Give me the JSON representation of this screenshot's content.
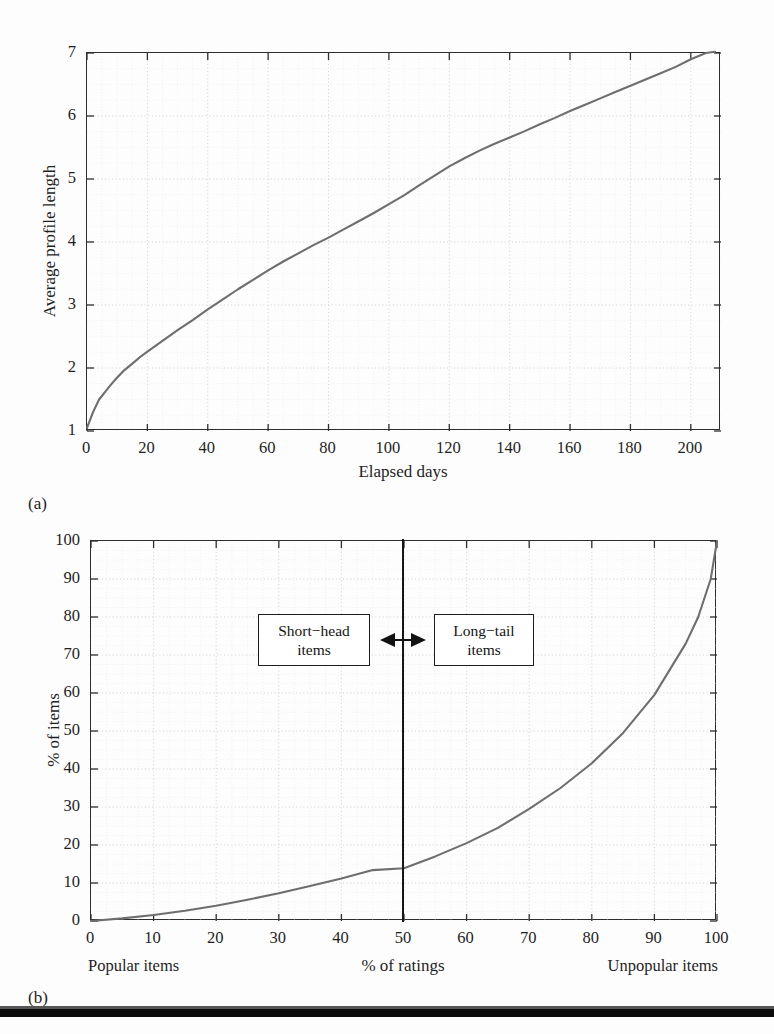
{
  "figure": {
    "background": "#fdfdfd",
    "ink_color": "#262626",
    "curve_color": "#6e6e6e",
    "grid_color": "#c9c9c9"
  },
  "panel_a": {
    "caption": "(a)",
    "chart_data": {
      "type": "line",
      "title": "",
      "xlabel": "Elapsed days",
      "ylabel": "Average profile length",
      "xlim": [
        0,
        210
      ],
      "ylim": [
        1,
        7
      ],
      "grid": true,
      "legend": "none",
      "xticks": [
        0,
        20,
        40,
        60,
        80,
        100,
        120,
        140,
        160,
        180,
        200
      ],
      "yticks": [
        1,
        2,
        3,
        4,
        5,
        6,
        7
      ],
      "series": [
        {
          "name": "Average profile length",
          "x": [
            0,
            2,
            4,
            5,
            6,
            8,
            10,
            12,
            14,
            16,
            18,
            20,
            25,
            30,
            35,
            40,
            45,
            50,
            55,
            60,
            65,
            70,
            75,
            80,
            85,
            90,
            95,
            100,
            105,
            110,
            115,
            120,
            125,
            130,
            135,
            140,
            145,
            150,
            155,
            160,
            165,
            170,
            175,
            180,
            185,
            190,
            195,
            200,
            205,
            208
          ],
          "y": [
            1.05,
            1.3,
            1.5,
            1.56,
            1.62,
            1.74,
            1.85,
            1.95,
            2.03,
            2.11,
            2.19,
            2.26,
            2.43,
            2.6,
            2.76,
            2.93,
            3.09,
            3.25,
            3.4,
            3.55,
            3.69,
            3.82,
            3.95,
            4.07,
            4.2,
            4.33,
            4.46,
            4.6,
            4.74,
            4.9,
            5.05,
            5.2,
            5.33,
            5.45,
            5.56,
            5.66,
            5.76,
            5.87,
            5.97,
            6.08,
            6.18,
            6.28,
            6.38,
            6.48,
            6.58,
            6.68,
            6.78,
            6.9,
            7.0,
            7.02
          ]
        }
      ]
    }
  },
  "panel_b": {
    "caption": "(b)",
    "left_corner_label": "Popular items",
    "right_corner_label": "Unpopular items",
    "annotations": [
      {
        "id": "short-head",
        "line1": "Short−head",
        "line2": "items"
      },
      {
        "id": "long-tail",
        "line1": "Long−tail",
        "line2": "items"
      }
    ],
    "divider": {
      "value": 50,
      "label": ""
    },
    "chart_data": {
      "type": "line",
      "title": "",
      "xlabel": "% of ratings",
      "ylabel": "% of items",
      "xlim": [
        0,
        100
      ],
      "ylim": [
        0,
        100
      ],
      "grid": true,
      "legend": "none",
      "xticks": [
        0,
        10,
        20,
        30,
        40,
        50,
        60,
        70,
        80,
        90,
        100
      ],
      "yticks": [
        0,
        10,
        20,
        30,
        40,
        50,
        60,
        70,
        80,
        90,
        100
      ],
      "annotation_divider_x": 50,
      "series": [
        {
          "name": "Cumulative item distribution",
          "x": [
            0,
            5,
            10,
            15,
            20,
            25,
            30,
            35,
            40,
            45,
            50,
            55,
            60,
            65,
            70,
            75,
            80,
            85,
            90,
            95,
            97,
            99,
            100
          ],
          "y": [
            0,
            0.7,
            1.6,
            2.7,
            4.0,
            5.6,
            7.3,
            9.2,
            11.2,
            13.4,
            13.9,
            17.0,
            20.5,
            24.5,
            29.5,
            35.0,
            41.5,
            49.5,
            59.5,
            73.0,
            80.0,
            90.0,
            100.0
          ]
        }
      ]
    }
  }
}
